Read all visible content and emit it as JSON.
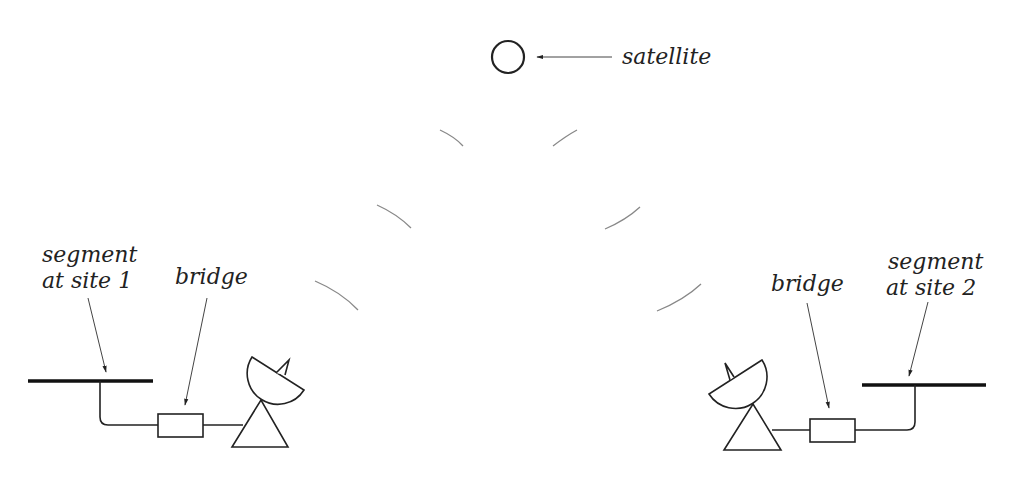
{
  "diagram": {
    "satellite": {
      "label": "satellite"
    },
    "site1": {
      "segment_label_line1": "segment",
      "segment_label_line2": "at site 1",
      "bridge_label": "bridge"
    },
    "site2": {
      "segment_label_line1": "segment",
      "segment_label_line2": "at site 2",
      "bridge_label": "bridge"
    }
  },
  "colors": {
    "stroke": "#222222",
    "wave": "#888888",
    "background": "#ffffff"
  }
}
